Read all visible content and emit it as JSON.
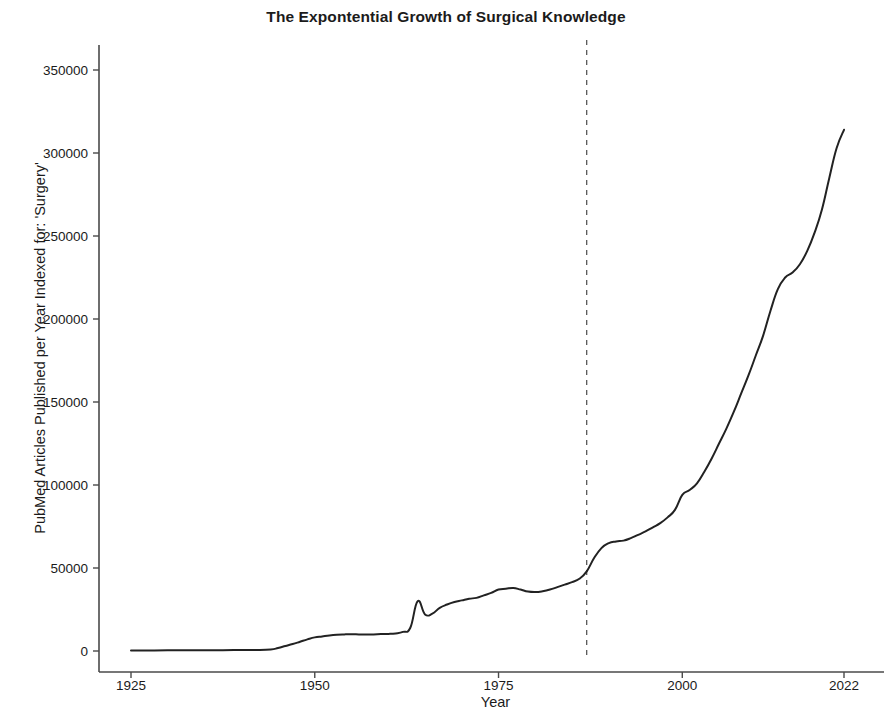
{
  "chart_data": {
    "type": "line",
    "title": "The Expontential Growth of Surgical Knowledge",
    "xlabel": "Year",
    "ylabel": "PubMed Articles Published per Year Indexed for: 'Surgery'",
    "xlim": [
      1919,
      2024
    ],
    "ylim": [
      -12000,
      360000
    ],
    "xticks": [
      1925,
      1950,
      1975,
      2000,
      2022
    ],
    "xticklabels": [
      "1925",
      "1950",
      "1975",
      "2000",
      "2022"
    ],
    "yticks": [
      0,
      50000,
      100000,
      150000,
      200000,
      250000,
      300000,
      350000
    ],
    "yticklabels": [
      "0",
      "50000",
      "100000",
      "150000",
      "200000",
      "250000",
      "300000",
      "350000"
    ],
    "grid": false,
    "legend": null,
    "line_color": "#222222",
    "line_width": 2.0,
    "annotations": [
      {
        "type": "vline",
        "name": "reference-year-line",
        "x": 1987,
        "style": "dashed",
        "color": "#3a3a3a",
        "width": 1.1
      }
    ],
    "x": [
      1925,
      1927,
      1930,
      1933,
      1936,
      1939,
      1942,
      1944,
      1945,
      1946,
      1947,
      1948,
      1949,
      1950,
      1951,
      1952,
      1953,
      1954,
      1955,
      1956,
      1957,
      1958,
      1959,
      1960,
      1961,
      1962,
      1963,
      1964,
      1965,
      1966,
      1967,
      1968,
      1969,
      1970,
      1971,
      1972,
      1973,
      1974,
      1975,
      1976,
      1977,
      1978,
      1979,
      1980,
      1981,
      1982,
      1983,
      1984,
      1985,
      1986,
      1987,
      1988,
      1989,
      1990,
      1991,
      1992,
      1993,
      1994,
      1995,
      1996,
      1997,
      1998,
      1999,
      2000,
      2001,
      2002,
      2003,
      2004,
      2005,
      2006,
      2007,
      2008,
      2009,
      2010,
      2011,
      2012,
      2013,
      2014,
      2015,
      2016,
      2017,
      2018,
      2019,
      2020,
      2021,
      2022
    ],
    "y": [
      300,
      350,
      400,
      450,
      500,
      550,
      600,
      900,
      1800,
      3000,
      4200,
      5600,
      7000,
      8200,
      8800,
      9400,
      9800,
      10000,
      10100,
      10000,
      9900,
      10000,
      10200,
      10300,
      10600,
      11500,
      14000,
      30000,
      22000,
      22500,
      26000,
      28000,
      29500,
      30500,
      31500,
      32000,
      33500,
      35000,
      37000,
      37500,
      38000,
      37000,
      35800,
      35500,
      36000,
      37000,
      38500,
      40000,
      41500,
      43500,
      48000,
      56000,
      62000,
      65000,
      66000,
      66500,
      68000,
      70000,
      72000,
      74500,
      77000,
      80500,
      85000,
      94000,
      97000,
      101000,
      108000,
      116000,
      125000,
      134000,
      144000,
      155000,
      166000,
      178000,
      190000,
      205000,
      218000,
      225000,
      228000,
      233000,
      241000,
      252000,
      266000,
      285000,
      303000,
      314000
    ]
  },
  "axis": {
    "spine_color": "#4a4a4a"
  }
}
